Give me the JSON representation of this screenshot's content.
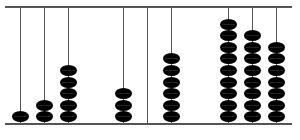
{
  "abacus": {
    "rods": [
      {
        "x": 20,
        "beads": 1
      },
      {
        "x": 44,
        "beads": 2
      },
      {
        "x": 68,
        "beads": 5
      },
      {
        "x": 123,
        "beads": 3
      },
      {
        "x": 147,
        "beads": 0
      },
      {
        "x": 171,
        "beads": 6
      },
      {
        "x": 228,
        "beads": 9
      },
      {
        "x": 252,
        "beads": 8
      },
      {
        "x": 276,
        "beads": 7
      }
    ],
    "bead_color": "#000000",
    "frame_color": "#555555"
  }
}
